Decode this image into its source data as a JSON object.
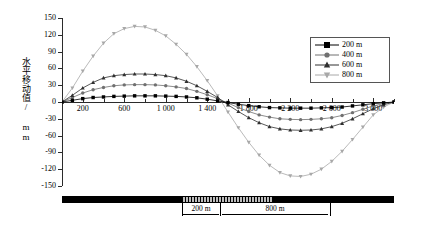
{
  "axes": {
    "y_title": "水平移动值/ mm",
    "y_ticks": [
      "150",
      "120",
      "90",
      "60",
      "30",
      "0",
      "-30",
      "-60",
      "-90",
      "-120",
      "-150"
    ],
    "x_ticks": [
      "200",
      "600",
      "1 000",
      "1 400",
      "1 800",
      "2 200",
      "2 600",
      "3 000"
    ]
  },
  "legend": {
    "items": [
      {
        "label": "200 m",
        "marker": "square",
        "color": "#000000"
      },
      {
        "label": "400 m",
        "marker": "circle",
        "color": "#707070"
      },
      {
        "label": "600 m",
        "marker": "triangle-up",
        "color": "#303030"
      },
      {
        "label": "800 m",
        "marker": "triangle-down",
        "color": "#a8a8a8"
      }
    ]
  },
  "annotations": {
    "dim_left": "200 m",
    "dim_right": "800 m"
  },
  "chart_data": {
    "type": "line",
    "title": "",
    "xlabel": "",
    "ylabel": "水平移动值/ mm",
    "xlim": [
      0,
      3200
    ],
    "ylim": [
      -150,
      150
    ],
    "y_ticks": [
      150,
      120,
      90,
      60,
      30,
      0,
      -30,
      -60,
      -90,
      -120,
      -150
    ],
    "x_ticks": [
      200,
      600,
      1000,
      1400,
      1800,
      2200,
      2600,
      3000
    ],
    "grid": false,
    "legend_position": "top-right",
    "x": [
      0,
      100,
      200,
      300,
      400,
      500,
      600,
      700,
      800,
      900,
      1000,
      1100,
      1200,
      1300,
      1400,
      1500,
      1600,
      1700,
      1800,
      1900,
      2000,
      2100,
      2200,
      2300,
      2400,
      2500,
      2600,
      2700,
      2800,
      2900,
      3000,
      3100,
      3200
    ],
    "series": [
      {
        "name": "200 m",
        "marker": "square",
        "color": "#000000",
        "values": [
          0,
          3,
          6,
          8,
          9,
          10,
          10.5,
          11,
          11,
          11,
          10.5,
          10,
          9,
          7.5,
          5,
          2,
          -1,
          -4,
          -6.5,
          -8.5,
          -10,
          -10.5,
          -11,
          -11,
          -11,
          -10.5,
          -10,
          -9,
          -7,
          -5,
          -3,
          -1.5,
          0
        ]
      },
      {
        "name": "400 m",
        "marker": "circle",
        "color": "#707070",
        "values": [
          0,
          8,
          16,
          22,
          26,
          29,
          30.5,
          31,
          31,
          30.5,
          29,
          27,
          24,
          19,
          13,
          6,
          -2,
          -10,
          -17,
          -23,
          -27,
          -30,
          -31,
          -31.5,
          -31,
          -30,
          -28,
          -24,
          -19,
          -13,
          -7,
          -3,
          0
        ]
      },
      {
        "name": "600 m",
        "marker": "triangle-up",
        "color": "#303030",
        "values": [
          0,
          12,
          25,
          35,
          43,
          47,
          49,
          50,
          50,
          49,
          47,
          43,
          37,
          29,
          19,
          8,
          -5,
          -17,
          -28,
          -37,
          -44,
          -48,
          -50,
          -50.5,
          -50,
          -48,
          -44,
          -38,
          -30,
          -21,
          -12,
          -5,
          0
        ]
      },
      {
        "name": "800 m",
        "marker": "triangle-down",
        "color": "#a8a8a8",
        "values": [
          0,
          25,
          55,
          82,
          105,
          122,
          131,
          135,
          134,
          128,
          118,
          103,
          85,
          63,
          38,
          11,
          -18,
          -46,
          -72,
          -95,
          -113,
          -126,
          -132,
          -133,
          -129,
          -120,
          -106,
          -88,
          -67,
          -45,
          -23,
          -9,
          0
        ]
      }
    ]
  }
}
